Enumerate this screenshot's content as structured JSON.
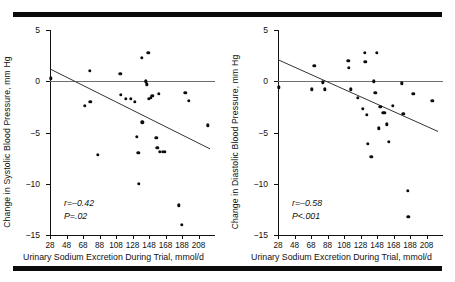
{
  "figure": {
    "top_rule": "black-bar",
    "bottom_rule": "black-bar"
  },
  "chart_data": [
    {
      "type": "scatter",
      "panel": "left",
      "title": "",
      "xlabel": "Urinary Sodium Excretion During Trial, mmol/d",
      "ylabel": "Change in Systolic Blood Pressure, mm Hg",
      "xlim": [
        28,
        228
      ],
      "ylim": [
        -15,
        5
      ],
      "xticks": [
        28,
        48,
        68,
        88,
        108,
        128,
        148,
        168,
        188,
        208
      ],
      "yticks": [
        5,
        0,
        -5,
        -10,
        -15
      ],
      "grid": false,
      "legend": "none",
      "annotations": {
        "r": "r=–0.42",
        "p": "P=.02"
      },
      "reference_line": {
        "y": 0,
        "color": "#6f6f6f"
      },
      "regression_line": {
        "x0": 28,
        "y0": 1.2,
        "x1": 222,
        "y1": -6.6,
        "color": "#333333"
      },
      "points": [
        [
          29,
          0.3
        ],
        [
          70,
          -2.4
        ],
        [
          76,
          1.0
        ],
        [
          77,
          -2.0
        ],
        [
          86,
          -7.2
        ],
        [
          113,
          0.7
        ],
        [
          114,
          -1.3
        ],
        [
          120,
          -1.7
        ],
        [
          126,
          -1.7
        ],
        [
          131,
          -2.0
        ],
        [
          133,
          -5.4
        ],
        [
          135,
          -7.0
        ],
        [
          136,
          -10.0
        ],
        [
          139,
          2.3
        ],
        [
          140,
          -4.0
        ],
        [
          144,
          0.0
        ],
        [
          145,
          -0.3
        ],
        [
          147,
          2.8
        ],
        [
          148,
          -1.7
        ],
        [
          150,
          -1.6
        ],
        [
          152,
          -1.4
        ],
        [
          157,
          -5.5
        ],
        [
          158,
          -6.5
        ],
        [
          160,
          -1.2
        ],
        [
          161,
          -6.9
        ],
        [
          165,
          -6.9
        ],
        [
          167,
          -6.9
        ],
        [
          184,
          -12.1
        ],
        [
          188,
          -14.0
        ],
        [
          192,
          -1.1
        ],
        [
          196,
          -1.9
        ],
        [
          219,
          -4.3
        ]
      ]
    },
    {
      "type": "scatter",
      "panel": "right",
      "title": "",
      "xlabel": "Urinary Sodium Excretion During Trial, mmol/d",
      "ylabel": "Change in Diastolic Blood Pressure, mm Hg",
      "xlim": [
        28,
        228
      ],
      "ylim": [
        -15,
        5
      ],
      "xticks": [
        28,
        48,
        68,
        88,
        108,
        128,
        148,
        168,
        188,
        208
      ],
      "yticks": [
        5,
        0,
        -5,
        -10,
        -15
      ],
      "grid": false,
      "legend": "none",
      "annotations": {
        "r": "r=–0.58",
        "p": "P<.001"
      },
      "reference_line": {
        "y": 0,
        "color": "#6f6f6f"
      },
      "regression_line": {
        "x0": 28,
        "y0": 2.1,
        "x1": 222,
        "y1": -4.9,
        "color": "#333333"
      },
      "points": [
        [
          29,
          -0.6
        ],
        [
          69,
          -0.8
        ],
        [
          72,
          1.5
        ],
        [
          82,
          -0.1
        ],
        [
          85,
          -0.8
        ],
        [
          113,
          2.0
        ],
        [
          114,
          1.3
        ],
        [
          116,
          -0.8
        ],
        [
          125,
          -1.6
        ],
        [
          131,
          -2.7
        ],
        [
          133,
          2.8
        ],
        [
          134,
          1.9
        ],
        [
          136,
          -3.3
        ],
        [
          137,
          -6.1
        ],
        [
          141,
          -7.4
        ],
        [
          144,
          0.0
        ],
        [
          146,
          -1.1
        ],
        [
          148,
          2.8
        ],
        [
          150,
          -4.6
        ],
        [
          152,
          -2.5
        ],
        [
          155,
          -3.1
        ],
        [
          157,
          -3.1
        ],
        [
          160,
          -4.2
        ],
        [
          162,
          -5.9
        ],
        [
          167,
          -2.4
        ],
        [
          178,
          -0.2
        ],
        [
          180,
          -3.2
        ],
        [
          185,
          -10.7
        ],
        [
          186,
          -13.2
        ],
        [
          192,
          -1.2
        ],
        [
          215,
          -1.9
        ]
      ]
    }
  ]
}
